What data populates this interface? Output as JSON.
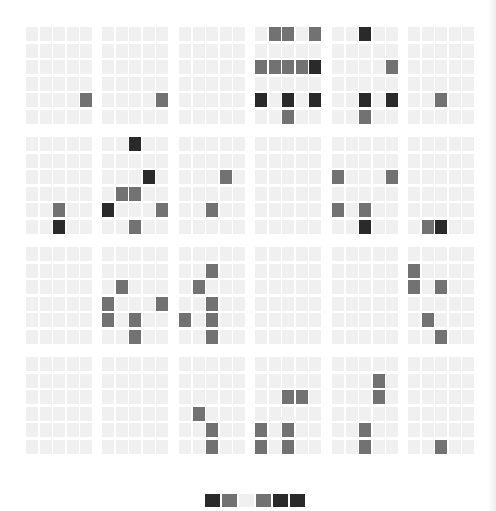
{
  "colors": {
    "light": "#f0f0f0",
    "gray": "#727272",
    "dark": "#2a2a2a"
  },
  "grid": {
    "block_rows": 4,
    "block_cols": 6,
    "cell_rows": 6,
    "cell_cols": 5,
    "block_lefts": [
      26,
      102,
      179,
      255,
      332,
      408
    ],
    "block_tops": [
      27,
      137,
      247,
      357
    ],
    "cell_pitch_x": 13.5,
    "cell_pitch_y": 16.5
  },
  "blocks": [
    [
      [
        0,
        0,
        0,
        0,
        0
      ],
      [
        0,
        0,
        0,
        0,
        0
      ],
      [
        0,
        0,
        0,
        0,
        0
      ],
      [
        0,
        0,
        0,
        0,
        0
      ],
      [
        0,
        0,
        0,
        0,
        1
      ],
      [
        0,
        0,
        0,
        0,
        0
      ]
    ],
    [
      [
        0,
        0,
        0,
        0,
        0
      ],
      [
        0,
        0,
        0,
        0,
        0
      ],
      [
        0,
        0,
        0,
        0,
        0
      ],
      [
        0,
        0,
        0,
        0,
        0
      ],
      [
        0,
        0,
        0,
        0,
        1
      ],
      [
        0,
        0,
        0,
        0,
        0
      ]
    ],
    [
      [
        0,
        0,
        0,
        0,
        0
      ],
      [
        0,
        0,
        0,
        0,
        0
      ],
      [
        0,
        0,
        0,
        0,
        0
      ],
      [
        0,
        0,
        0,
        0,
        0
      ],
      [
        0,
        0,
        0,
        0,
        0
      ],
      [
        0,
        0,
        0,
        0,
        0
      ]
    ],
    [
      [
        0,
        1,
        1,
        0,
        1
      ],
      [
        0,
        0,
        0,
        0,
        0
      ],
      [
        1,
        1,
        1,
        1,
        2
      ],
      [
        0,
        0,
        0,
        0,
        0
      ],
      [
        2,
        0,
        2,
        0,
        2
      ],
      [
        0,
        0,
        1,
        0,
        0
      ]
    ],
    [
      [
        0,
        0,
        2,
        0,
        0
      ],
      [
        0,
        0,
        0,
        0,
        0
      ],
      [
        0,
        0,
        0,
        0,
        1
      ],
      [
        0,
        0,
        0,
        0,
        0
      ],
      [
        0,
        0,
        2,
        0,
        2
      ],
      [
        0,
        0,
        1,
        0,
        0
      ]
    ],
    [
      [
        0,
        0,
        0,
        0,
        0
      ],
      [
        0,
        0,
        0,
        0,
        0
      ],
      [
        0,
        0,
        0,
        0,
        0
      ],
      [
        0,
        0,
        0,
        0,
        0
      ],
      [
        0,
        0,
        1,
        0,
        0
      ],
      [
        0,
        0,
        0,
        0,
        0
      ]
    ],
    [
      [
        0,
        0,
        0,
        0,
        0
      ],
      [
        0,
        0,
        0,
        0,
        0
      ],
      [
        0,
        0,
        0,
        0,
        0
      ],
      [
        0,
        0,
        0,
        0,
        0
      ],
      [
        0,
        0,
        1,
        0,
        0
      ],
      [
        0,
        0,
        2,
        0,
        0
      ]
    ],
    [
      [
        0,
        0,
        2,
        0,
        0
      ],
      [
        0,
        0,
        0,
        0,
        0
      ],
      [
        0,
        0,
        0,
        2,
        0
      ],
      [
        0,
        1,
        1,
        0,
        0
      ],
      [
        2,
        0,
        0,
        0,
        1
      ],
      [
        0,
        0,
        1,
        0,
        0
      ]
    ],
    [
      [
        0,
        0,
        0,
        0,
        0
      ],
      [
        0,
        0,
        0,
        0,
        0
      ],
      [
        0,
        0,
        0,
        1,
        0
      ],
      [
        0,
        0,
        0,
        0,
        0
      ],
      [
        0,
        0,
        1,
        0,
        0
      ],
      [
        0,
        0,
        0,
        0,
        0
      ]
    ],
    [
      [
        0,
        0,
        0,
        0,
        0
      ],
      [
        0,
        0,
        0,
        0,
        0
      ],
      [
        0,
        0,
        0,
        0,
        0
      ],
      [
        0,
        0,
        0,
        0,
        0
      ],
      [
        0,
        0,
        0,
        0,
        0
      ],
      [
        0,
        0,
        0,
        0,
        0
      ]
    ],
    [
      [
        0,
        0,
        0,
        0,
        0
      ],
      [
        0,
        0,
        0,
        0,
        0
      ],
      [
        1,
        0,
        0,
        0,
        1
      ],
      [
        0,
        0,
        0,
        0,
        0
      ],
      [
        1,
        0,
        1,
        0,
        0
      ],
      [
        0,
        0,
        2,
        0,
        0
      ]
    ],
    [
      [
        0,
        0,
        0,
        0,
        0
      ],
      [
        0,
        0,
        0,
        0,
        0
      ],
      [
        0,
        0,
        0,
        0,
        0
      ],
      [
        0,
        0,
        0,
        0,
        0
      ],
      [
        0,
        0,
        0,
        0,
        0
      ],
      [
        0,
        1,
        2,
        0,
        0
      ]
    ],
    [
      [
        0,
        0,
        0,
        0,
        0
      ],
      [
        0,
        0,
        0,
        0,
        0
      ],
      [
        0,
        0,
        0,
        0,
        0
      ],
      [
        0,
        0,
        0,
        0,
        0
      ],
      [
        0,
        0,
        0,
        0,
        0
      ],
      [
        0,
        0,
        0,
        0,
        0
      ]
    ],
    [
      [
        0,
        0,
        0,
        0,
        0
      ],
      [
        0,
        0,
        0,
        0,
        0
      ],
      [
        0,
        1,
        0,
        0,
        0
      ],
      [
        1,
        0,
        0,
        0,
        1
      ],
      [
        1,
        0,
        1,
        0,
        0
      ],
      [
        0,
        0,
        1,
        0,
        0
      ]
    ],
    [
      [
        0,
        0,
        0,
        0,
        0
      ],
      [
        0,
        0,
        1,
        0,
        0
      ],
      [
        0,
        1,
        0,
        0,
        0
      ],
      [
        0,
        0,
        1,
        0,
        0
      ],
      [
        1,
        0,
        1,
        0,
        0
      ],
      [
        0,
        0,
        1,
        0,
        0
      ]
    ],
    [
      [
        0,
        0,
        0,
        0,
        0
      ],
      [
        0,
        0,
        0,
        0,
        0
      ],
      [
        0,
        0,
        0,
        0,
        0
      ],
      [
        0,
        0,
        0,
        0,
        0
      ],
      [
        0,
        0,
        0,
        0,
        0
      ],
      [
        0,
        0,
        0,
        0,
        0
      ]
    ],
    [
      [
        0,
        0,
        0,
        0,
        0
      ],
      [
        0,
        0,
        0,
        0,
        0
      ],
      [
        0,
        0,
        0,
        0,
        0
      ],
      [
        0,
        0,
        0,
        0,
        0
      ],
      [
        0,
        0,
        0,
        0,
        0
      ],
      [
        0,
        0,
        0,
        0,
        0
      ]
    ],
    [
      [
        0,
        0,
        0,
        0,
        0
      ],
      [
        1,
        0,
        0,
        0,
        0
      ],
      [
        1,
        0,
        1,
        0,
        0
      ],
      [
        0,
        0,
        0,
        0,
        0
      ],
      [
        0,
        1,
        0,
        0,
        0
      ],
      [
        0,
        0,
        1,
        0,
        0
      ]
    ],
    [
      [
        0,
        0,
        0,
        0,
        0
      ],
      [
        0,
        0,
        0,
        0,
        0
      ],
      [
        0,
        0,
        0,
        0,
        0
      ],
      [
        0,
        0,
        0,
        0,
        0
      ],
      [
        0,
        0,
        0,
        0,
        0
      ],
      [
        0,
        0,
        0,
        0,
        0
      ]
    ],
    [
      [
        0,
        0,
        0,
        0,
        0
      ],
      [
        0,
        0,
        0,
        0,
        0
      ],
      [
        0,
        0,
        0,
        0,
        0
      ],
      [
        0,
        0,
        0,
        0,
        0
      ],
      [
        0,
        0,
        0,
        0,
        0
      ],
      [
        0,
        0,
        0,
        0,
        0
      ]
    ],
    [
      [
        0,
        0,
        0,
        0,
        0
      ],
      [
        0,
        0,
        0,
        0,
        0
      ],
      [
        0,
        0,
        0,
        0,
        0
      ],
      [
        0,
        1,
        0,
        0,
        0
      ],
      [
        0,
        0,
        1,
        0,
        0
      ],
      [
        0,
        0,
        1,
        0,
        0
      ]
    ],
    [
      [
        0,
        0,
        0,
        0,
        0
      ],
      [
        0,
        0,
        0,
        0,
        0
      ],
      [
        0,
        0,
        1,
        1,
        0
      ],
      [
        0,
        0,
        0,
        0,
        0
      ],
      [
        1,
        0,
        1,
        0,
        0
      ],
      [
        1,
        0,
        1,
        0,
        0
      ]
    ],
    [
      [
        0,
        0,
        0,
        0,
        0
      ],
      [
        0,
        0,
        0,
        1,
        0
      ],
      [
        0,
        0,
        0,
        1,
        0
      ],
      [
        0,
        0,
        0,
        0,
        0
      ],
      [
        0,
        0,
        1,
        0,
        0
      ],
      [
        0,
        0,
        1,
        0,
        0
      ]
    ],
    [
      [
        0,
        0,
        0,
        0,
        0
      ],
      [
        0,
        0,
        0,
        0,
        0
      ],
      [
        0,
        0,
        0,
        0,
        0
      ],
      [
        0,
        0,
        0,
        0,
        0
      ],
      [
        0,
        0,
        0,
        0,
        0
      ],
      [
        0,
        0,
        1,
        0,
        0
      ]
    ]
  ],
  "legend": {
    "cells": [
      2,
      1,
      0,
      1,
      2,
      2
    ],
    "left": 205,
    "pitch": 17
  }
}
